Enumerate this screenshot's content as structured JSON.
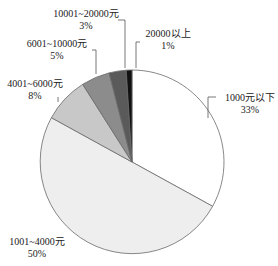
{
  "chart_data": {
    "type": "pie",
    "title": "",
    "start_angle": "12 o'clock",
    "direction": "clockwise",
    "categories": [
      "1000元以下",
      "1001~4000元",
      "4001~6000元",
      "6001~10000元",
      "10001~20000元",
      "20000以上"
    ],
    "values": [
      33,
      50,
      8,
      5,
      3,
      1
    ],
    "unit": "%",
    "colors": [
      "#ffffff",
      "#eeeeee",
      "#c8c8c8",
      "#8c8c8c",
      "#5a5a5a",
      "#111111"
    ],
    "labels": [
      {
        "name": "1000元以下",
        "pct": "33%"
      },
      {
        "name": "1001~4000元",
        "pct": "50%"
      },
      {
        "name": "4001~6000元",
        "pct": "8%"
      },
      {
        "name": "6001~10000元",
        "pct": "5%"
      },
      {
        "name": "10001~20000元",
        "pct": "3%"
      },
      {
        "name": "20000以上",
        "pct": "1%"
      }
    ],
    "legend": "none (inline labels with leader lines)"
  }
}
